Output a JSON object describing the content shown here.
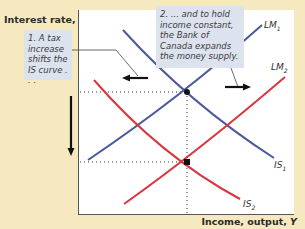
{
  "diagram": {
    "type": "IS-LM policy mix",
    "axes": {
      "y_label": "Interest rate, ",
      "y_var": "r",
      "x_label": "Income, output, ",
      "x_var": "Y"
    },
    "callouts": [
      {
        "id": "1",
        "text": "1. A tax increase shifts the IS curve . . ."
      },
      {
        "id": "2",
        "text": "2. ... and to hold income constant, the Bank of Canada expands the money supply."
      }
    ],
    "curves": [
      {
        "name": "LM",
        "sub": "1",
        "color": "#4a5a9a"
      },
      {
        "name": "LM",
        "sub": "2",
        "color": "#d9363e"
      },
      {
        "name": "IS",
        "sub": "1",
        "color": "#4a5a9a"
      },
      {
        "name": "IS",
        "sub": "2",
        "color": "#d9363e"
      }
    ],
    "equilibria": [
      {
        "label": "initial",
        "note": "IS1 ∩ LM1"
      },
      {
        "label": "final",
        "note": "IS2 ∩ LM2"
      }
    ],
    "arrows": [
      {
        "direction": "left",
        "meaning": "IS shifts left"
      },
      {
        "direction": "right",
        "meaning": "LM shifts right"
      },
      {
        "direction": "down",
        "meaning": "interest rate falls"
      }
    ],
    "colors": {
      "background": "#f6e9bf",
      "plot": "#ffffff",
      "callout": "#dde3ee",
      "blue": "#4a5a9a",
      "red": "#d9363e"
    }
  }
}
